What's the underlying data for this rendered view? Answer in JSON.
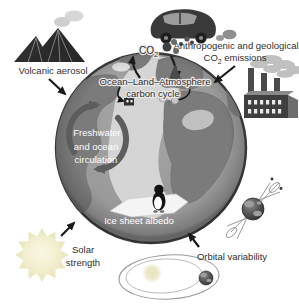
{
  "labels": {
    "volcanic_aerosol": "Volcanic aerosol",
    "anthropogenic_line1": "Anthropogenic and geological",
    "co2_prefix": "CO",
    "co2_sub": "2",
    "emissions_suffix": "emissions",
    "co2_label_prefix": "CO",
    "co2_label_sub": "2",
    "carbon_cycle_line1": "Ocean–Land–Atmosphere",
    "carbon_cycle_line2": "carbon cycle",
    "freshwater_line1": "Freshwater",
    "freshwater_line2": "and ocean",
    "freshwater_line3": "circulation",
    "ice_sheet_albedo": "Ice sheet albedo",
    "solar_line1": "Solar",
    "solar_line2": "strength",
    "orbital_variability": "Orbital variability"
  },
  "icons": [
    "volcano-icon",
    "volcano-smoke-icon",
    "car-icon",
    "exhaust-smoke-icon",
    "factory-icon",
    "factory-smoke-icon",
    "co2-molecule-icon",
    "globe",
    "atlantic-ocean",
    "continents",
    "cloud-icon",
    "tree-icon",
    "mini-factory-icon",
    "tree-cluster-icon",
    "circulation-cycle-arrows-icon",
    "penguin-icon",
    "ice-sheet-icon",
    "sun-icon",
    "orbit-ellipses-icon",
    "orbit-sun-icon",
    "orbiting-earth-icon",
    "precession-earth-icon",
    "precession-cones-icon",
    "arrow-volcano-to-globe",
    "arrow-emissions-to-globe",
    "arrow-sun-to-globe",
    "arrow-orbital-to-globe",
    "co2-up-arrow",
    "co2-down-arrow"
  ],
  "colors": {
    "background": "#ffffff",
    "ocean": "#9a9a9a",
    "land": "#7b7b7b",
    "atlantic_light": "#d5d5d5",
    "globe_rim": "#3a3a3a",
    "arrow_black": "#1a1a1a",
    "cycle_arrow_gray": "#5d5d5d",
    "sun_body": "#f6f3d8",
    "sun_rays": "#ebe7c0",
    "smoke_gray": "#c9c9c9",
    "dark_icon": "#333333",
    "white_text": "#ffffff",
    "dark_text": "#2f2f2f"
  }
}
